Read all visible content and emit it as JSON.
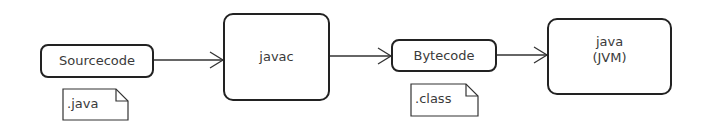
{
  "diagram": {
    "nodes": [
      {
        "id": "sourcecode",
        "label": "Sourcecode"
      },
      {
        "id": "javac",
        "label": "javac"
      },
      {
        "id": "bytecode",
        "label": "Bytecode"
      },
      {
        "id": "jvm",
        "label_line1": "java",
        "label_line2": "(JVM)"
      }
    ],
    "notes": [
      {
        "attached_to": "sourcecode",
        "label": ".java"
      },
      {
        "attached_to": "bytecode",
        "label": ".class"
      }
    ],
    "edges": [
      {
        "from": "sourcecode",
        "to": "javac"
      },
      {
        "from": "javac",
        "to": "bytecode"
      },
      {
        "from": "bytecode",
        "to": "jvm"
      }
    ]
  }
}
